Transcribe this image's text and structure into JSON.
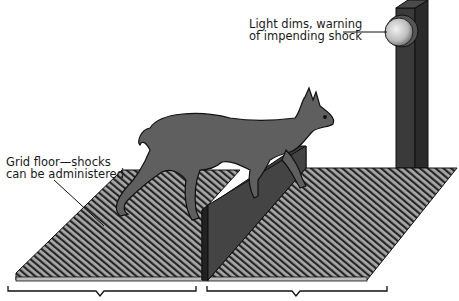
{
  "diagram": {
    "labels": {
      "light_line1": "Light dims, warning",
      "light_line2": "of impending shock",
      "grid_line1": "Grid floor—shocks",
      "grid_line2": "can be administered"
    },
    "elements": [
      "dog",
      "left-grid-floor",
      "right-grid-floor",
      "barrier",
      "light-post",
      "warning-light",
      "left-bracket",
      "right-bracket"
    ],
    "colors": {
      "background": "#ffffff",
      "grid_dark": "#2a2a2a",
      "grid_light": "#a8a8a8",
      "barrier": "#3c3c3c",
      "post": "#3a3a3a",
      "dog": "#5f5f5f",
      "light": "#d8d8d8",
      "text": "#1a1a1a"
    }
  }
}
